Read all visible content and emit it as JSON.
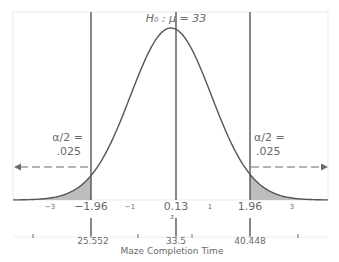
{
  "chart_data": {
    "type": "area",
    "title": "",
    "hypothesis_label": "H₀ : μ = 33",
    "distribution": "standard normal",
    "xlabel_z": "z",
    "xlabel_raw": "Maze Completion Time",
    "z_ticks": [
      {
        "value": -3,
        "label": "−3"
      },
      {
        "value": -1,
        "label": "−1"
      },
      {
        "value": 1,
        "label": "1"
      },
      {
        "value": 3,
        "label": "3"
      }
    ],
    "critical_values": [
      {
        "z": -1.96,
        "label": "−1.96",
        "raw": 25.552,
        "raw_label": "25.552"
      },
      {
        "z": 1.96,
        "label": "1.96",
        "raw": 40.448,
        "raw_label": "40.448"
      }
    ],
    "observed": {
      "z": 0.13,
      "label": "0.13",
      "raw": 33.5,
      "raw_label": "33.5"
    },
    "tails": [
      {
        "side": "left",
        "alpha_label_line1": "α/2 =",
        "alpha_label_line2": ".025",
        "area": 0.025
      },
      {
        "side": "right",
        "alpha_label_line1": "α/2 =",
        "alpha_label_line2": ".025",
        "area": 0.025
      }
    ],
    "raw_minor_ticks_z": [
      -3.5,
      -1,
      1,
      3.5
    ],
    "xlim_z": [
      -4,
      4
    ],
    "grid": false,
    "legend": "none",
    "colors": {
      "curve": "#555555",
      "lines": "#555555",
      "tail_fill": "#bdbdbd",
      "frame": "#e6e6e6",
      "text": "#6a6a6a"
    }
  }
}
